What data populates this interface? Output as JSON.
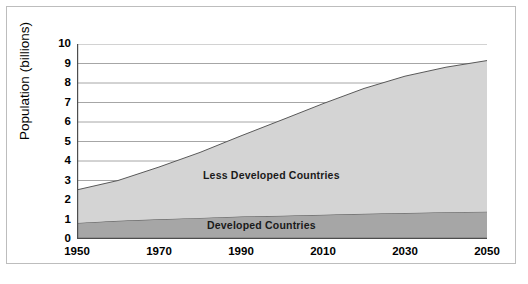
{
  "chart_data": {
    "type": "area",
    "stacked": true,
    "title": "",
    "xlabel": "",
    "ylabel": "Population (billions)",
    "xlim": [
      1950,
      2050
    ],
    "ylim": [
      0,
      10
    ],
    "grid": true,
    "legend_position": "inline-annotations",
    "x_tick_labels": [
      "1950",
      "1970",
      "1990",
      "2010",
      "2030",
      "2050"
    ],
    "x_ticks": [
      1950,
      1970,
      1990,
      2010,
      2030,
      2050
    ],
    "y_tick_labels": [
      "0",
      "1",
      "2",
      "3",
      "4",
      "5",
      "6",
      "7",
      "8",
      "9",
      "10"
    ],
    "y_ticks": [
      0,
      1,
      2,
      3,
      4,
      5,
      6,
      7,
      8,
      9,
      10
    ],
    "x": [
      1950,
      1960,
      1970,
      1980,
      1990,
      2000,
      2010,
      2020,
      2030,
      2040,
      2050
    ],
    "series": [
      {
        "name": "Developed Countries",
        "color": "#a6a6a6",
        "values": [
          0.82,
          0.93,
          1.01,
          1.08,
          1.15,
          1.19,
          1.24,
          1.29,
          1.33,
          1.37,
          1.4
        ]
      },
      {
        "name": "Less Developed Countries",
        "color": "#d4d4d4",
        "values": [
          1.7,
          2.07,
          2.68,
          3.36,
          4.14,
          4.92,
          5.7,
          6.43,
          7.02,
          7.44,
          7.75
        ]
      }
    ],
    "totals": [
      2.52,
      3.0,
      3.69,
      4.44,
      5.29,
      6.11,
      6.94,
      7.72,
      8.35,
      8.81,
      9.15
    ],
    "annotations": [
      {
        "text": "Less Developed Countries",
        "name": "annotation-less-developed"
      },
      {
        "text": "Developed Countries",
        "name": "annotation-developed"
      }
    ],
    "colors": {
      "less_developed_fill": "#d4d4d4",
      "developed_fill": "#a6a6a6",
      "gridline": "#8f8f8f",
      "axis": "#4d4d4d",
      "series_line": "#595959",
      "frame": "#bdbdbd",
      "background": "#ffffff"
    }
  }
}
